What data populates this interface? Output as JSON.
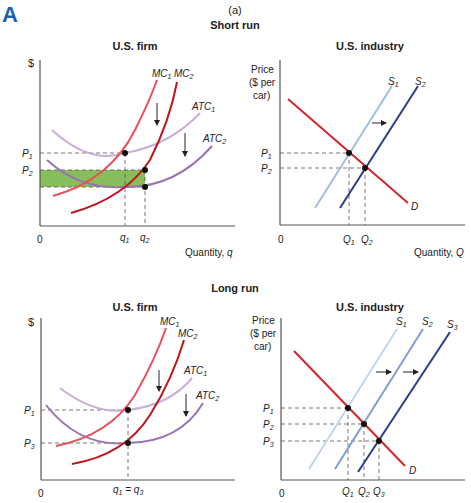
{
  "figure": {
    "label": "A",
    "panel_label": "(a)",
    "sections": {
      "short_run": "Short run",
      "long_run": "Long run"
    }
  },
  "colors": {
    "mc1": "#e8505b",
    "mc2": "#c0141c",
    "atc1": "#c9aed6",
    "atc2": "#9a72b4",
    "s1": "#9fbfe0",
    "s2": "#2c3a8c",
    "s2_long": "#7f9fd0",
    "s3": "#2c3a8c",
    "demand": "#d1262b",
    "profit_area": "#7ab648",
    "label_accent": "#1f5fae"
  },
  "short_run": {
    "firm": {
      "title": "U.S. firm",
      "y_axis_label": "$",
      "x_axis_label": "Quantity, q",
      "origin": "0",
      "price_labels": [
        "P1",
        "P2"
      ],
      "quantity_labels": [
        "q1",
        "q2"
      ],
      "curves": [
        "MC1",
        "MC2",
        "ATC1",
        "ATC2"
      ],
      "shaded_area": "profit (green rectangle between P2 and ATC2 at q2)"
    },
    "industry": {
      "title": "U.S. industry",
      "y_axis_label": [
        "Price",
        "($ per",
        "car)"
      ],
      "x_axis_label": "Quantity, Q",
      "origin": "0",
      "price_labels": [
        "P1",
        "P2"
      ],
      "quantity_labels": [
        "Q1",
        "Q2"
      ],
      "curves": [
        "S1",
        "S2",
        "D"
      ]
    }
  },
  "long_run": {
    "firm": {
      "title": "U.S. firm",
      "y_axis_label": "$",
      "origin": "0",
      "price_labels": [
        "P1",
        "P3"
      ],
      "quantity_labels": [
        "q1 = q3"
      ],
      "curves": [
        "MC1",
        "MC2",
        "ATC1",
        "ATC2"
      ]
    },
    "industry": {
      "title": "U.S. industry",
      "y_axis_label": [
        "Price",
        "($ per",
        "car)"
      ],
      "origin": "0",
      "price_labels": [
        "P1",
        "P2",
        "P3"
      ],
      "quantity_labels": [
        "Q1",
        "Q2",
        "Q3"
      ],
      "curves": [
        "S1",
        "S2",
        "S3",
        "D"
      ]
    }
  }
}
